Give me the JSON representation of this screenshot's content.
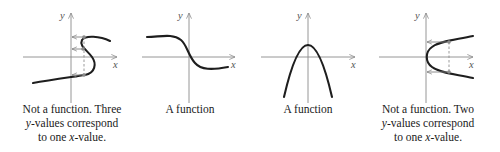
{
  "figure": {
    "axis_labels": {
      "x": "x",
      "y": "y"
    },
    "panels": [
      {
        "id": "s-curve",
        "caption_lines": [
          "Not a function. Three",
          "y-values correspond",
          "to one x-value."
        ],
        "is_function": false
      },
      {
        "id": "decreasing-sigmoid",
        "caption_lines": [
          "A function"
        ],
        "is_function": true
      },
      {
        "id": "downward-parabola",
        "caption_lines": [
          "A function"
        ],
        "is_function": true
      },
      {
        "id": "sideways-parabola",
        "caption_lines": [
          "Not a function. Two",
          "y-values correspond",
          "to one x-value."
        ],
        "is_function": false
      }
    ]
  },
  "colors": {
    "curve": "#1e1e1e",
    "axis": "#8a8a8a",
    "text": "#1a1a1a"
  }
}
